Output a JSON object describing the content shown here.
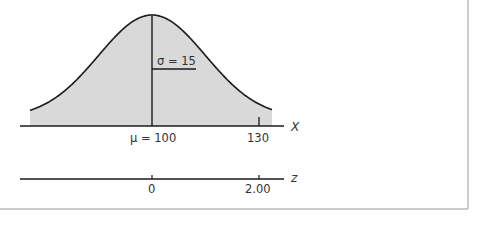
{
  "chart_data": {
    "type": "area",
    "title": "",
    "distribution": {
      "name": "normal",
      "mean": 100,
      "sd": 15
    },
    "x_axis": {
      "label": "X",
      "ticks": [
        {
          "value": 100,
          "label": "μ = 100"
        },
        {
          "value": 130,
          "label": "130"
        }
      ]
    },
    "z_axis": {
      "label": "z",
      "ticks": [
        {
          "value": 0,
          "label": "0"
        },
        {
          "value": 2.0,
          "label": "2.00"
        }
      ]
    },
    "annotations": [
      {
        "text": "σ = 15",
        "type": "horizontal segment from mean to one SD at inflection point"
      }
    ],
    "shaded_region": "entire area under curve",
    "colors": {
      "fill": "#d9d9d9",
      "stroke": "#1a1a1a",
      "frame": "#bbbbbb"
    },
    "grid": false,
    "legend": null
  },
  "labels": {
    "sigma": "σ = 15",
    "mu": "μ = 100",
    "x130": "130",
    "x_axis": "X",
    "z0": "0",
    "z2": "2.00",
    "z_axis": "z"
  }
}
